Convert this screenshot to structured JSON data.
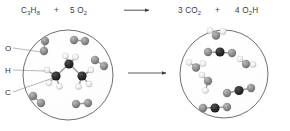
{
  "equation": {
    "reactant_1": {
      "formula": "C",
      "sub_1": "3",
      "element_2": "H",
      "sub_2": "8",
      "full": "C3H8"
    },
    "plus_left": "+",
    "reactant_2": {
      "coefficient": "5",
      "formula": "O",
      "sub": "2",
      "full": "5 O2"
    },
    "arrow": "→",
    "product_1": {
      "coefficient": "3",
      "formula": "CO",
      "sub": "2",
      "full": "3 CO2"
    },
    "plus_right": "+",
    "product_2": {
      "coefficient": "4",
      "formula": "H",
      "sub_1": "2",
      "element_2": "O",
      "full": "4 H2O"
    }
  },
  "legend": {
    "items": [
      {
        "label": "O",
        "name": "oxygen",
        "color": "#8e8e8e"
      },
      {
        "label": "H",
        "name": "hydrogen",
        "color": "#efefef"
      },
      {
        "label": "C",
        "name": "carbon",
        "color": "#2a2a2a"
      }
    ]
  },
  "colors": {
    "oxygen": "#8e8e8e",
    "oxygen_dark": "#6f6f6f",
    "hydrogen": "#f2f2f2",
    "hydrogen_edge": "#bcbcbc",
    "carbon": "#262626",
    "circle_stroke": "#4a4a4a",
    "bond": "#9a9a9a",
    "text": "#3b3b3b",
    "background": "#ffffff"
  },
  "panels": {
    "left": {
      "name": "reactants-container",
      "caption": "propane and oxygen molecules"
    },
    "right": {
      "name": "products-container",
      "caption": "carbon dioxide and water molecules"
    }
  }
}
